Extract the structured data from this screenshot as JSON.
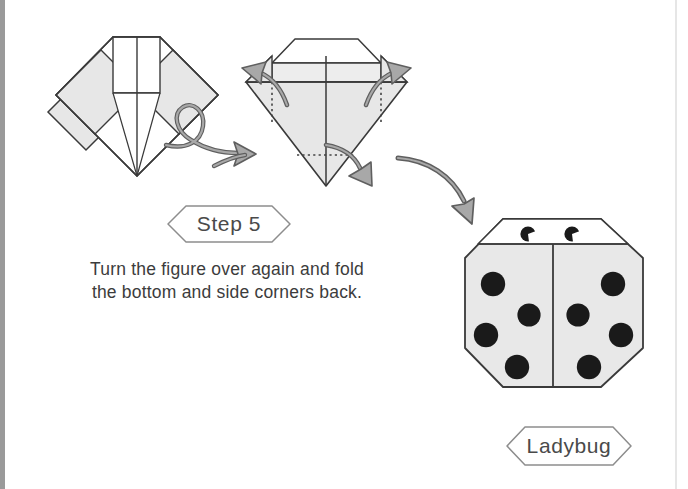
{
  "page": {
    "width": 688,
    "height": 489,
    "background": "#ffffff",
    "binding_edge_color": "#9a9a9a",
    "right_margin_rule_color": "#d8d8d8"
  },
  "colors": {
    "paper_outline": "#3a3a3a",
    "paper_white": "#ffffff",
    "paper_shaded": "#e7e7e7",
    "paper_shaded_light": "#efefef",
    "arrow_stroke": "#5a5a5a",
    "arrow_fill": "#a8a8a8",
    "fold_line_dotted": "#555555",
    "spot_color": "#1a1a1a",
    "banner_outline": "#8d8d8d",
    "text_color": "#3c3c3c",
    "banner_text_color": "#4a4a4a"
  },
  "step_banner": {
    "label": "Step 5",
    "shape": "hexagon-banner",
    "x": 168,
    "y": 205,
    "width": 122,
    "height": 38
  },
  "result_banner": {
    "label": "Ladybug",
    "shape": "hexagon-banner",
    "x": 507,
    "y": 427,
    "width": 124,
    "height": 38
  },
  "instruction": {
    "line1": "Turn the figure over again and fold",
    "line2": "the bottom and side corners back."
  },
  "figures": [
    {
      "id": "figure-before",
      "name": "origami-figure-before-fold",
      "description": "Square rotated 45 degrees with flat top edge, white upper rectangle, two gray shaded side flaps and vertical center crease."
    },
    {
      "id": "figure-folding",
      "name": "origami-figure-folding",
      "description": "Shaded diamond with dotted fold lines at left, right and bottom, with three fold arrows."
    },
    {
      "id": "figure-ladybug",
      "name": "origami-figure-ladybug",
      "description": "Finished octagonal ladybug with white head, two eyes and eight black spots."
    }
  ],
  "arrows": [
    {
      "name": "turn-over-loop-arrow",
      "direction": "right",
      "meaning": "turn the figure over"
    },
    {
      "name": "fold-arrow-upper-left",
      "direction": "up-left",
      "meaning": "fold left corner back"
    },
    {
      "name": "fold-arrow-upper-right",
      "direction": "up-right",
      "meaning": "fold right corner back"
    },
    {
      "name": "fold-arrow-bottom",
      "direction": "down-right",
      "meaning": "fold bottom corner back"
    },
    {
      "name": "result-arrow",
      "direction": "down-right",
      "meaning": "leads to finished model"
    }
  ],
  "ladybug": {
    "head_fill": "#ffffff",
    "body_fill": "#e8e8e8",
    "eyes": [
      {
        "cx": 528,
        "cy": 234,
        "r": 7.5
      },
      {
        "cx": 572,
        "cy": 234,
        "r": 7.5
      }
    ],
    "spots": [
      {
        "cx": 493,
        "cy": 284,
        "r": 12
      },
      {
        "cx": 529,
        "cy": 315,
        "r": 11.5
      },
      {
        "cx": 486,
        "cy": 335,
        "r": 12
      },
      {
        "cx": 517,
        "cy": 367,
        "r": 12
      },
      {
        "cx": 613,
        "cy": 284,
        "r": 12
      },
      {
        "cx": 578,
        "cy": 315,
        "r": 11.5
      },
      {
        "cx": 621,
        "cy": 335,
        "r": 12
      },
      {
        "cx": 589,
        "cy": 367,
        "r": 12
      }
    ],
    "spot_count": 8,
    "eye_count": 2
  }
}
